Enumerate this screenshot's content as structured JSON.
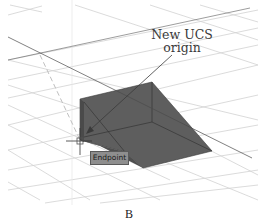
{
  "figure": {
    "callout_line1": "New UCS",
    "callout_line2": "origin",
    "snap_tooltip": "Endpoint",
    "caption": "B"
  },
  "colors": {
    "background": "#ffffff",
    "grid": "#cfcfcf",
    "solid_fill": "#5e5e5e",
    "solid_edge": "#2e2e2e",
    "leader": "#3a3a3a",
    "tooltip_bg": "#8e8e8e"
  }
}
